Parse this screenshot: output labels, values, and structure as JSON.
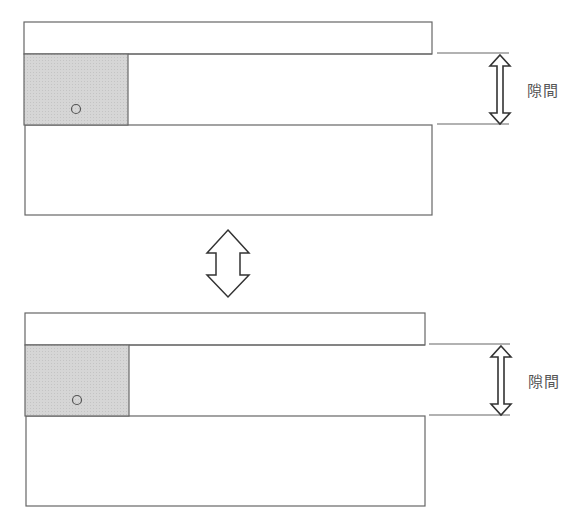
{
  "diagram": {
    "top_panel": {
      "gap_label": "隙間",
      "marker": "○"
    },
    "bottom_panel": {
      "gap_label": "隙間",
      "marker": "○"
    },
    "transition_arrow": "double-vertical-arrow",
    "colors": {
      "stroke": "#666666",
      "block_fill": "#d4d4d4",
      "background": "#ffffff",
      "text": "#555555"
    }
  }
}
